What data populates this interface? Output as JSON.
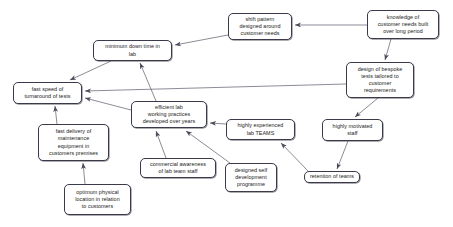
{
  "diagram": {
    "background_color": "#ffffff",
    "node_border_color": "#3a3a4a",
    "edge_color": "#5a5a6a",
    "nodes": [
      {
        "id": "shift-pattern",
        "label": "shift pattern\ndesigned around\ncustomer needs",
        "x": 228,
        "y": 13,
        "w": 64,
        "h": 27
      },
      {
        "id": "knowledge-customer-needs",
        "label": "knowledge of\ncustomer needs built\nover long period",
        "x": 367,
        "y": 10,
        "w": 72,
        "h": 29
      },
      {
        "id": "minimum-down-time",
        "label": "minimum down time in\nlab",
        "x": 93,
        "y": 40,
        "w": 79,
        "h": 21
      },
      {
        "id": "design-bespoke-tests",
        "label": "design of bespoke\ntests tailored to\ncustomer\nrequirements",
        "x": 346,
        "y": 62,
        "w": 68,
        "h": 36
      },
      {
        "id": "fast-speed-turnaround",
        "label": "fast speed of\nturnaround of tests",
        "x": 13,
        "y": 82,
        "w": 69,
        "h": 22
      },
      {
        "id": "efficient-lab-practices",
        "label": "efficient lab\nworking practices\ndeveloped over years",
        "x": 131,
        "y": 101,
        "w": 76,
        "h": 27
      },
      {
        "id": "highly-experienced-teams",
        "label": "highly experienced\nlab TEAMS",
        "x": 226,
        "y": 119,
        "w": 69,
        "h": 21
      },
      {
        "id": "highly-motivated-staff",
        "label": "highly motivated\nstaff",
        "x": 322,
        "y": 119,
        "w": 61,
        "h": 22
      },
      {
        "id": "fast-delivery-maintenance",
        "label": "fast delivery of\nmaintenance\nequipment in\ncustomers premises",
        "x": 38,
        "y": 124,
        "w": 71,
        "h": 37
      },
      {
        "id": "commercial-awareness",
        "label": "commercial awareness\nof lab team staff",
        "x": 140,
        "y": 158,
        "w": 76,
        "h": 20
      },
      {
        "id": "designed-self-development",
        "label": "designed self\ndevelopment\nprogramme",
        "x": 225,
        "y": 163,
        "w": 52,
        "h": 29
      },
      {
        "id": "retention-of-teams",
        "label": "retention of teams",
        "x": 304,
        "y": 171,
        "w": 56,
        "h": 12
      },
      {
        "id": "optimum-physical-location",
        "label": "optimum physical\nlocation in relation\nto customers",
        "x": 64,
        "y": 184,
        "w": 67,
        "h": 31
      }
    ],
    "edges": [
      {
        "id": "edge-knowledge-to-shift",
        "from": "knowledge-customer-needs",
        "to": "shift-pattern"
      },
      {
        "id": "edge-knowledge-to-design",
        "from": "knowledge-customer-needs",
        "to": "design-bespoke-tests"
      },
      {
        "id": "edge-shift-to-minimum",
        "from": "shift-pattern",
        "to": "minimum-down-time"
      },
      {
        "id": "edge-minimum-to-fast-speed",
        "from": "minimum-down-time",
        "to": "fast-speed-turnaround"
      },
      {
        "id": "edge-efficient-to-minimum",
        "from": "efficient-lab-practices",
        "to": "minimum-down-time"
      },
      {
        "id": "edge-design-to-fast-speed",
        "from": "design-bespoke-tests",
        "to": "fast-speed-turnaround"
      },
      {
        "id": "edge-efficient-to-fast-speed",
        "from": "efficient-lab-practices",
        "to": "fast-speed-turnaround"
      },
      {
        "id": "edge-design-to-motivated",
        "from": "design-bespoke-tests",
        "to": "highly-motivated-staff"
      },
      {
        "id": "edge-experienced-to-efficient",
        "from": "highly-experienced-teams",
        "to": "efficient-lab-practices"
      },
      {
        "id": "edge-commercial-to-efficient",
        "from": "commercial-awareness",
        "to": "efficient-lab-practices"
      },
      {
        "id": "edge-development-to-efficient",
        "from": "designed-self-development",
        "to": "efficient-lab-practices"
      },
      {
        "id": "edge-motivated-to-retention",
        "from": "highly-motivated-staff",
        "to": "retention-of-teams"
      },
      {
        "id": "edge-retention-to-experienced",
        "from": "retention-of-teams",
        "to": "highly-experienced-teams"
      },
      {
        "id": "edge-delivery-to-fast-speed",
        "from": "fast-delivery-maintenance",
        "to": "fast-speed-turnaround"
      },
      {
        "id": "edge-optimum-to-delivery",
        "from": "optimum-physical-location",
        "to": "fast-delivery-maintenance"
      }
    ],
    "edge_geometry": [
      {
        "id": "edge-knowledge-to-shift",
        "x1": 367,
        "y1": 25,
        "x2": 295,
        "y2": 25
      },
      {
        "id": "edge-knowledge-to-design",
        "x1": 391,
        "y1": 39,
        "x2": 385,
        "y2": 60
      },
      {
        "id": "edge-shift-to-minimum",
        "x1": 228,
        "y1": 35,
        "x2": 175,
        "y2": 45
      },
      {
        "id": "edge-minimum-to-fast-speed",
        "x1": 111,
        "y1": 61,
        "x2": 70,
        "y2": 80
      },
      {
        "id": "edge-efficient-to-minimum",
        "x1": 156,
        "y1": 101,
        "x2": 140,
        "y2": 63
      },
      {
        "id": "edge-design-to-fast-speed",
        "x1": 346,
        "y1": 84,
        "x2": 85,
        "y2": 91
      },
      {
        "id": "edge-efficient-to-fast-speed",
        "x1": 131,
        "y1": 110,
        "x2": 85,
        "y2": 98
      },
      {
        "id": "edge-design-to-motivated",
        "x1": 378,
        "y1": 98,
        "x2": 355,
        "y2": 117
      },
      {
        "id": "edge-experienced-to-efficient",
        "x1": 226,
        "y1": 124,
        "x2": 210,
        "y2": 123
      },
      {
        "id": "edge-commercial-to-efficient",
        "x1": 166,
        "y1": 158,
        "x2": 156,
        "y2": 131
      },
      {
        "id": "edge-development-to-efficient",
        "x1": 230,
        "y1": 163,
        "x2": 186,
        "y2": 131
      },
      {
        "id": "edge-motivated-to-retention",
        "x1": 348,
        "y1": 141,
        "x2": 337,
        "y2": 169
      },
      {
        "id": "edge-retention-to-experienced",
        "x1": 308,
        "y1": 171,
        "x2": 281,
        "y2": 143
      },
      {
        "id": "edge-delivery-to-fast-speed",
        "x1": 57,
        "y1": 124,
        "x2": 55,
        "y2": 106
      },
      {
        "id": "edge-optimum-to-delivery",
        "x1": 85,
        "y1": 184,
        "x2": 83,
        "y2": 163
      }
    ]
  }
}
